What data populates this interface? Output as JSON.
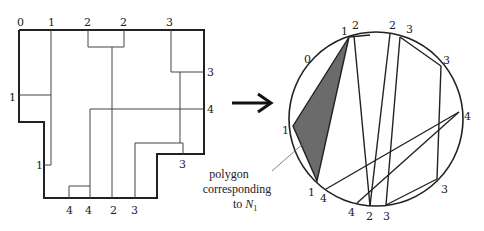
{
  "left_figure": {
    "top_labels": [
      "0",
      "1",
      "2",
      "2",
      "3"
    ],
    "right_labels": [
      "3",
      "4"
    ],
    "left_labels": [
      "1",
      "1"
    ],
    "bottom_labels": [
      "4",
      "4",
      "2",
      "3"
    ],
    "step_label": "3"
  },
  "arrow": {
    "icon": "right-arrow-icon"
  },
  "right_figure": {
    "circle_labels": [
      "0",
      "1",
      "2",
      "2",
      "3",
      "3",
      "4",
      "3",
      "3",
      "2",
      "4",
      "4",
      "1",
      "1"
    ],
    "shaded_color": "#6b6b6b"
  },
  "annotation": {
    "line1": "polygon",
    "line2": "corresponding",
    "line3_prefix": "to ",
    "line3_var": "N",
    "line3_sub": "1"
  }
}
